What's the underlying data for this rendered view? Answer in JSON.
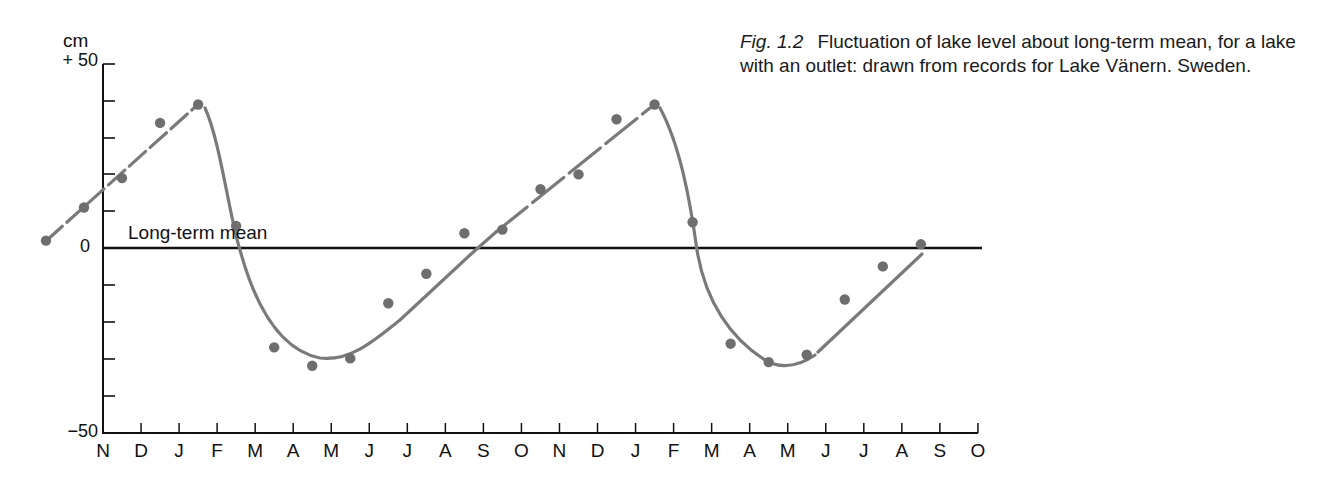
{
  "caption": {
    "figure_label": "Fig. 1.2",
    "text": "Fluctuation of lake level about long-term mean, for a lake with an outlet: drawn from records for Lake Vänern. Sweden."
  },
  "axes": {
    "y_unit": "cm",
    "y_top_label": "+ 50",
    "y_zero_label": "0",
    "y_bottom_label": "−50",
    "mean_line_label": "Long-term mean"
  },
  "colors": {
    "axis": "#111111",
    "series": "#7a7a7a",
    "points": "#6e6e6e"
  },
  "chart_data": {
    "type": "scatter",
    "xlabel": "Month",
    "ylabel": "cm",
    "ylim": [
      -50,
      50
    ],
    "yticks": [
      -50,
      -40,
      -30,
      -20,
      -10,
      0,
      10,
      20,
      30,
      40,
      50
    ],
    "grid": false,
    "legend": null,
    "categories": [
      "N",
      "D",
      "J",
      "F",
      "M",
      "A",
      "M",
      "J",
      "J",
      "A",
      "S",
      "O",
      "N",
      "D",
      "J",
      "F",
      "M",
      "A",
      "M",
      "J",
      "J",
      "A",
      "S",
      "O"
    ],
    "annotations": [
      {
        "text": "Long-term mean",
        "y": 0
      }
    ],
    "series": [
      {
        "name": "Observed lake level (monthly)",
        "x_position_months_from_first_N": [
          -1.5,
          -0.5,
          0.5,
          1.5,
          2.5,
          3.5,
          4.5,
          5.5,
          6.5,
          7.5,
          8.5,
          9.5,
          10.5,
          11.5,
          12.5,
          13.5,
          14.5,
          15.5,
          16.5,
          17.5,
          18.5,
          19.5,
          20.5,
          21.5
        ],
        "values": [
          2,
          11,
          19,
          34,
          39,
          6,
          -27,
          -32,
          -30,
          -15,
          -7,
          4,
          5,
          16,
          20,
          35,
          39,
          7,
          -26,
          -31,
          -29,
          -14,
          -5,
          1
        ]
      },
      {
        "name": "Fitted curve",
        "description": "Linear rise from Nov to Feb peak (~+39), steep fall through Mar/Apr to minimum (~-30) in May, then linear rise through summer/autumn; pattern repeats"
      }
    ]
  },
  "x_labels": [
    "N",
    "D",
    "J",
    "F",
    "M",
    "A",
    "M",
    "J",
    "J",
    "A",
    "S",
    "O",
    "N",
    "D",
    "J",
    "F",
    "M",
    "A",
    "M",
    "J",
    "J",
    "A",
    "S",
    "O"
  ]
}
